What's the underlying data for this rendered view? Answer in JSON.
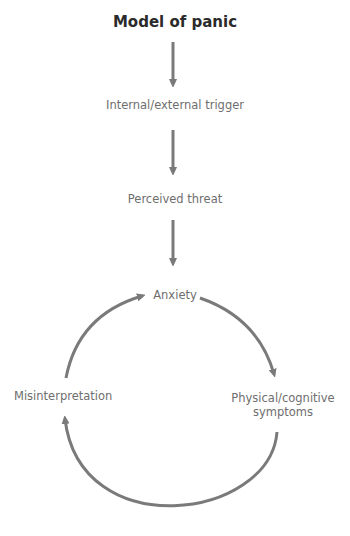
{
  "title": "Model of panic",
  "colors": {
    "arrow": "#7a7a7a",
    "text": "#6e6e6e",
    "title": "#2b2b2b"
  },
  "nodes": {
    "trigger": "Internal/external trigger",
    "threat": "Perceived threat",
    "anxiety": "Anxiety",
    "symptoms_line1": "Physical/cognitive",
    "symptoms_line2": "symptoms",
    "misinterpretation": "Misinterpretation"
  },
  "edges": [
    {
      "from": "title",
      "to": "trigger"
    },
    {
      "from": "trigger",
      "to": "threat"
    },
    {
      "from": "threat",
      "to": "anxiety"
    },
    {
      "from": "anxiety",
      "to": "symptoms"
    },
    {
      "from": "symptoms",
      "to": "misinterpretation"
    },
    {
      "from": "misinterpretation",
      "to": "anxiety"
    }
  ]
}
